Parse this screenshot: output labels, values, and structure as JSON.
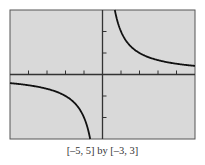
{
  "chart_data": {
    "type": "line",
    "title": "",
    "function": "y = 2/x",
    "xlabel": "",
    "ylabel": "",
    "xlim": [
      -5,
      5
    ],
    "ylim": [
      -3,
      3
    ],
    "x_ticks": [
      -4,
      -3,
      -2,
      -1,
      1,
      2,
      3,
      4
    ],
    "y_ticks": [
      -2,
      -1,
      1,
      2
    ],
    "grid": false,
    "series": [
      {
        "name": "right branch",
        "x": [
          0.67,
          0.75,
          1,
          1.5,
          2,
          2.5,
          3,
          3.5,
          4,
          4.5,
          5
        ],
        "values": [
          3,
          2.67,
          2,
          1.33,
          1,
          0.8,
          0.67,
          0.57,
          0.5,
          0.44,
          0.4
        ]
      },
      {
        "name": "left branch",
        "x": [
          -5,
          -4.5,
          -4,
          -3.5,
          -3,
          -2.5,
          -2,
          -1.5,
          -1,
          -0.75,
          -0.67
        ],
        "values": [
          -0.4,
          -0.44,
          -0.5,
          -0.57,
          -0.67,
          -0.8,
          -1,
          -1.33,
          -2,
          -2.67,
          -3
        ]
      }
    ],
    "caption": "[–5, 5] by [–3, 3]",
    "colors": {
      "background": "#d9d9d9",
      "curve": "#111111",
      "axes": "#333333",
      "frame": "#555555"
    }
  }
}
